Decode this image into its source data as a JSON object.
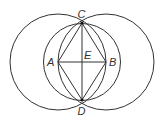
{
  "diagram": {
    "points": {
      "A": {
        "label": "A",
        "x": 58,
        "y": 62
      },
      "B": {
        "label": "B",
        "x": 106,
        "y": 62
      },
      "C": {
        "label": "C",
        "x": 82,
        "y": 23
      },
      "D": {
        "label": "D",
        "x": 82,
        "y": 100
      },
      "E": {
        "label": "E",
        "x": 82,
        "y": 62
      }
    },
    "circles": [
      {
        "name": "circle-center-A",
        "cx": 58,
        "cy": 62,
        "r": 48
      },
      {
        "name": "circle-center-B",
        "cx": 106,
        "cy": 62,
        "r": 48
      },
      {
        "name": "circle-center-E",
        "cx": 82,
        "cy": 62,
        "r": 38.5
      }
    ],
    "segments": [
      "AC",
      "CB",
      "BD",
      "DA",
      "AB",
      "CD"
    ],
    "stroke_color": "#333333"
  }
}
